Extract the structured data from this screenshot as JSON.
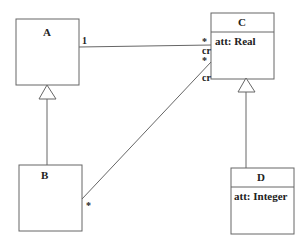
{
  "diagram": {
    "type": "uml-class-diagram",
    "classes": [
      {
        "id": "A",
        "name": "A",
        "attributes": []
      },
      {
        "id": "B",
        "name": "B",
        "attributes": []
      },
      {
        "id": "C",
        "name": "C",
        "attributes": [
          "att: Real"
        ]
      },
      {
        "id": "D",
        "name": "D",
        "attributes": [
          "att: Integer"
        ]
      }
    ],
    "relationships": [
      {
        "type": "generalization",
        "from": "B",
        "to": "A"
      },
      {
        "type": "generalization",
        "from": "D",
        "to": "C"
      },
      {
        "type": "association",
        "from": "A",
        "to": "C",
        "from_multiplicity": "1",
        "to_multiplicity": "*",
        "to_role": "cr"
      },
      {
        "type": "association",
        "from": "B",
        "to": "C",
        "from_multiplicity": "*",
        "to_multiplicity": "*",
        "to_role": "cr"
      }
    ],
    "labels": {
      "a_name": "A",
      "b_name": "B",
      "c_name": "C",
      "d_name": "D",
      "c_attr": "att: Real",
      "d_attr": "att: Integer",
      "ac_mult_a": "1",
      "ac_mult_c": "*",
      "ac_role_c": "cr",
      "bc_mult_c": "*",
      "bc_role_c": "cr",
      "bc_mult_b": "*"
    },
    "colors": {
      "line": "#555555",
      "text": "#222222",
      "background": "#ffffff"
    }
  }
}
